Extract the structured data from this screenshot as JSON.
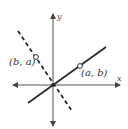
{
  "diagram": {
    "axes": {
      "x_label": "x",
      "y_label": "y"
    },
    "lines": [
      {
        "name": "line-through-a-b",
        "style": "solid",
        "description": "line through origin and (a, b)"
      },
      {
        "name": "reflected-line",
        "style": "dashed",
        "description": "line through origin and (b, a)"
      }
    ],
    "points": [
      {
        "label": "(a, b)",
        "marker": "open-circle"
      },
      {
        "label": "(b, a)",
        "marker": "open-circle"
      }
    ],
    "colors": {
      "stroke": "#2a2a2a",
      "axis": "#444444",
      "background": "#ffffff"
    }
  }
}
